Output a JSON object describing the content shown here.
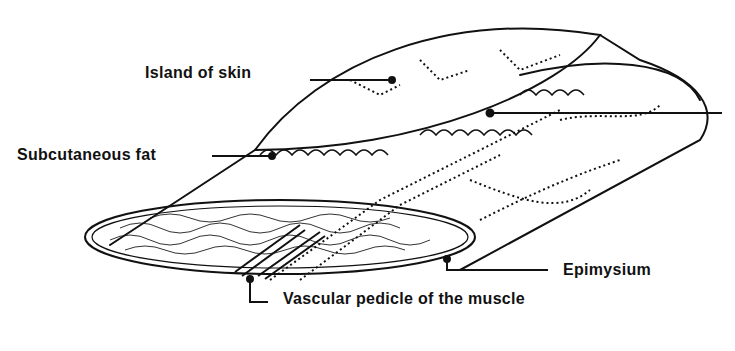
{
  "diagram": {
    "title": "",
    "labels": {
      "island_of_skin": "Island of skin",
      "subcutaneous_fat": "Subcutaneous fat",
      "epimysium": "Epimysium",
      "vascular_pedicle": "Vascular pedicle of the muscle",
      "unlabeled_right_pointer": ""
    },
    "colors": {
      "ink": "#111111",
      "background": "#ffffff"
    }
  }
}
